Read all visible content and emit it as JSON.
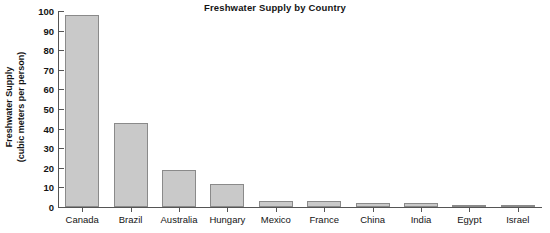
{
  "chart_data": {
    "type": "bar",
    "title": "Freshwater Supply by Country",
    "xlabel": "",
    "ylabel": "Freshwater Supply\n(cubic meters per person)",
    "ylabel_line1": "Freshwater Supply",
    "ylabel_line2": "(cubic meters per person)",
    "categories": [
      "Canada",
      "Brazil",
      "Australia",
      "Hungary",
      "Mexico",
      "France",
      "China",
      "India",
      "Egypt",
      "Israel"
    ],
    "values": [
      98,
      43,
      19,
      11.5,
      3,
      3,
      2,
      2,
      0.7,
      0.5
    ],
    "ylim": [
      0,
      100
    ],
    "ytick_values": [
      0,
      10,
      20,
      30,
      40,
      50,
      60,
      70,
      80,
      90,
      100
    ],
    "ytick_labels": [
      "0",
      "10",
      "20",
      "30",
      "40",
      "50",
      "60",
      "70",
      "80",
      "90",
      "100"
    ],
    "grid": false,
    "legend": null,
    "bar_fill_color": "#c9c9c9",
    "bar_edge_color": "#8a8a8a",
    "axis_color": "#555555",
    "text_color": "#141414"
  }
}
